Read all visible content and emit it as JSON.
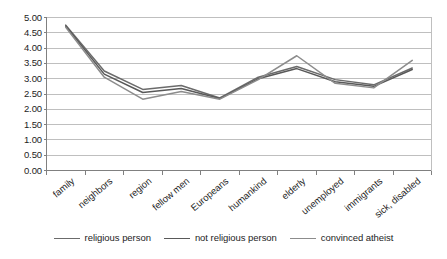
{
  "chart_data": {
    "type": "line",
    "title": "",
    "subtitle": "",
    "xlabel": "",
    "ylabel": "",
    "categories": [
      "family",
      "neighbors",
      "region",
      "fellow men",
      "Europeans",
      "humankind",
      "elderly",
      "unemployed",
      "immigrants",
      "sick, disabled"
    ],
    "series": [
      {
        "name": "religious person",
        "color": "#6b6b6b",
        "values": [
          4.75,
          3.25,
          2.65,
          2.78,
          2.37,
          3.05,
          3.4,
          2.97,
          2.8,
          3.35
        ]
      },
      {
        "name": "not religious person",
        "color": "#595959",
        "values": [
          4.72,
          3.15,
          2.55,
          2.68,
          2.35,
          3.0,
          3.33,
          2.9,
          2.75,
          3.3
        ]
      },
      {
        "name": "convinced atheist",
        "color": "#8c8c8c",
        "values": [
          4.68,
          3.05,
          2.33,
          2.58,
          2.33,
          2.97,
          3.75,
          2.85,
          2.7,
          3.6
        ]
      }
    ],
    "ylim": [
      0.0,
      5.0
    ],
    "ystep": 0.5,
    "ytick_labels": [
      "5.00",
      "4.50",
      "4.00",
      "3.50",
      "3.00",
      "2.50",
      "2.00",
      "1.50",
      "1.00",
      "0.50",
      "0.00"
    ],
    "ytick_values": [
      5.0,
      4.5,
      4.0,
      3.5,
      3.0,
      2.5,
      2.0,
      1.5,
      1.0,
      0.5,
      0.0
    ],
    "grid": "horizontal",
    "legend_position": "bottom",
    "markers": "none",
    "axis_color": "#808080",
    "grid_color": "#bfbfbf",
    "background": "#ffffff"
  },
  "legend": {
    "items": [
      {
        "label": "religious person",
        "color": "#6b6b6b"
      },
      {
        "label": "not religious person",
        "color": "#595959"
      },
      {
        "label": "convinced atheist",
        "color": "#8c8c8c"
      }
    ]
  }
}
